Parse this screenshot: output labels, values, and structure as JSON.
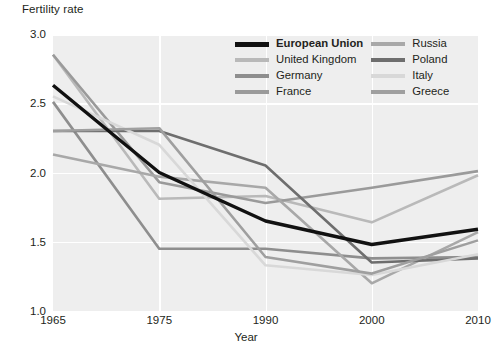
{
  "chart_data": {
    "type": "line",
    "title": "",
    "ylabel": "Fertility rate",
    "xlabel": "Year",
    "x": [
      "1965",
      "1975",
      "1990",
      "2000",
      "2010"
    ],
    "ylim": [
      1.0,
      3.0
    ],
    "ytick_labels": [
      "1.0",
      "1.5",
      "2.0",
      "2.5",
      "3.0"
    ],
    "ytick_values": [
      1.0,
      1.5,
      2.0,
      2.5,
      3.0
    ],
    "grid": "horizontal-and-vertical-white-on-gray",
    "legend_position": "top-right-inside",
    "series": [
      {
        "name": "European Union",
        "color": "#111111",
        "width": 3.4,
        "bold": true,
        "values": [
          2.63,
          2.0,
          1.65,
          1.48,
          1.59
        ]
      },
      {
        "name": "United Kingdom",
        "color": "#b9b9b9",
        "width": 2.6,
        "bold": false,
        "values": [
          2.85,
          1.81,
          1.83,
          1.64,
          1.98
        ]
      },
      {
        "name": "Germany",
        "color": "#8e8e8e",
        "width": 2.6,
        "bold": false,
        "values": [
          2.51,
          1.45,
          1.45,
          1.38,
          1.39
        ]
      },
      {
        "name": "France",
        "color": "#9a9a9a",
        "width": 2.6,
        "bold": false,
        "values": [
          2.85,
          1.93,
          1.78,
          1.89,
          2.01
        ]
      },
      {
        "name": "Russia",
        "color": "#a8a8a8",
        "width": 2.6,
        "bold": false,
        "values": [
          2.13,
          1.97,
          1.89,
          1.2,
          1.57
        ]
      },
      {
        "name": "Poland",
        "color": "#6e6e6e",
        "width": 2.6,
        "bold": false,
        "values": [
          2.3,
          2.3,
          2.05,
          1.35,
          1.38
        ]
      },
      {
        "name": "Italy",
        "color": "#d8d8d8",
        "width": 2.6,
        "bold": false,
        "values": [
          2.55,
          2.2,
          1.33,
          1.26,
          1.41
        ]
      },
      {
        "name": "Greece",
        "color": "#9f9f9f",
        "width": 2.6,
        "bold": false,
        "values": [
          2.3,
          2.32,
          1.39,
          1.27,
          1.51
        ]
      }
    ]
  },
  "legend": {
    "order": [
      "European Union",
      "United Kingdom",
      "Germany",
      "France",
      "Russia",
      "Poland",
      "Italy",
      "Greece"
    ]
  }
}
